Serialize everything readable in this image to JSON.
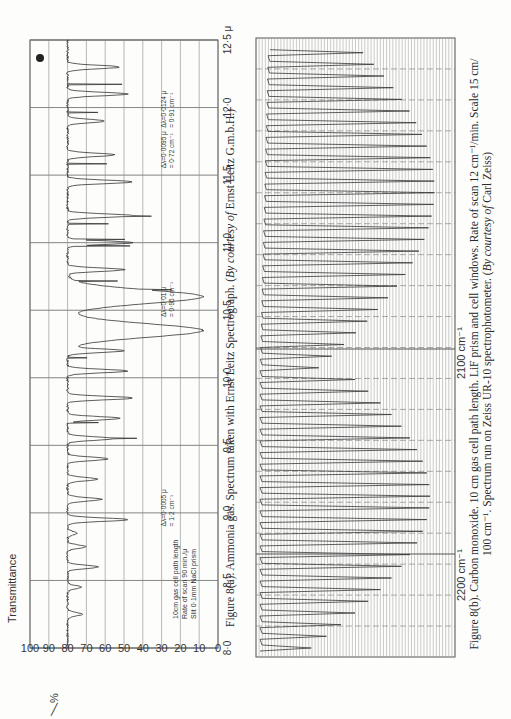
{
  "figure_a": {
    "caption_prefix": "Figure 8(a). Ammonia gas. Spectrum taken with Ernst Leitz Spectrograph. (",
    "caption_italic": "By courtesy of",
    "caption_suffix": " Ernst Leitz G.m.b.H.)",
    "y_axis_label": "Transmittance",
    "y_axis_unit": "%",
    "y_ticks": [
      "100",
      "90",
      "80",
      "70",
      "60",
      "50",
      "40",
      "30",
      "20",
      "10",
      "0"
    ],
    "x_ticks": [
      "8·0",
      "8·5",
      "9·0",
      "9·5",
      "10·0",
      "10·5",
      "11·0",
      "11·5",
      "12·0",
      "12·5 μ"
    ],
    "conditions": [
      "10cm gas cell path length",
      "Rate of scan 90 min./μ",
      "Slit 0·1mm NaCl prism"
    ],
    "annotations": [
      {
        "text1": "Δλ=0·0005 μ",
        "text2": "= 1·2 cm⁻¹",
        "at": 8.9
      },
      {
        "text1": "Δλ=0·01 μ",
        "text2": "= 0·95 cm⁻¹",
        "at": 10.45
      },
      {
        "text1": "Δλ=0·0095 μ",
        "text2": "= 0·72 cm⁻¹",
        "at": 11.55
      },
      {
        "text1": "Δλ=0·0124 μ",
        "text2": "= 0·91 cm⁻¹",
        "at": 11.85
      }
    ]
  },
  "figure_b": {
    "caption_line1_prefix": "Figure 8(b). Carbon monoxide. 10 cm gas cell path length. LiF prism and cell windows. Rate of scan 12 cm⁻¹/min. Scale 15 cm/",
    "caption_line2_prefix": "100 cm⁻¹. Spectrum run on Zeiss UR-10 spectrophotometer. (",
    "caption_italic": "By courtesy of",
    "caption_suffix": " Carl Zeiss)",
    "x_labels": [
      "2200 cm⁻¹",
      "2100 cm⁻¹"
    ]
  },
  "chart_data": [
    {
      "type": "line",
      "title": "Figure 8(a). Ammonia gas. Spectrum taken with Ernst Leitz Spectrograph.",
      "xlabel": "Wavelength (μ)",
      "ylabel": "Transmittance %",
      "xlim": [
        8.0,
        12.5
      ],
      "ylim": [
        0,
        100
      ],
      "grid": true,
      "x_ticks": [
        8.0,
        8.5,
        9.0,
        9.5,
        10.0,
        10.5,
        11.0,
        11.5,
        12.0,
        12.5
      ],
      "y_ticks": [
        0,
        10,
        20,
        30,
        40,
        50,
        60,
        70,
        80,
        90,
        100
      ],
      "baseline_transmittance": 80,
      "bands": [
        {
          "center": 8.25,
          "min_T": 72
        },
        {
          "center": 8.45,
          "min_T": 73
        },
        {
          "center": 8.6,
          "min_T": 64
        },
        {
          "center": 8.75,
          "min_T": 70
        },
        {
          "center": 8.85,
          "min_T": 75
        },
        {
          "center": 8.95,
          "min_T": 48
        },
        {
          "center": 9.1,
          "min_T": 62
        },
        {
          "center": 9.25,
          "min_T": 64
        },
        {
          "center": 9.4,
          "min_T": 58
        },
        {
          "center": 9.55,
          "min_T": 55
        },
        {
          "center": 9.7,
          "min_T": 52
        },
        {
          "center": 9.85,
          "min_T": 45
        },
        {
          "center": 10.05,
          "min_T": 48
        },
        {
          "center": 10.2,
          "min_T": 50
        },
        {
          "center": 10.35,
          "min_T": 8
        },
        {
          "center": 10.6,
          "min_T": 8
        },
        {
          "center": 10.8,
          "min_T": 50
        },
        {
          "center": 11.0,
          "min_T": 45
        },
        {
          "center": 11.2,
          "min_T": 45
        },
        {
          "center": 11.45,
          "min_T": 45
        },
        {
          "center": 11.65,
          "min_T": 55
        },
        {
          "center": 11.9,
          "min_T": 60
        },
        {
          "center": 12.1,
          "min_T": 48
        },
        {
          "center": 12.3,
          "min_T": 52
        }
      ],
      "annotations": [
        "Δλ=0·0005 μ = 1·2 cm⁻¹",
        "Δλ=0·01 μ = 0·95 cm⁻¹",
        "Δλ=0·0095 μ = 0·72 cm⁻¹",
        "Δλ=0·0124 μ = 0·91 cm⁻¹"
      ],
      "conditions": [
        "10cm gas cell path length",
        "Rate of scan 90 min./μ",
        "Slit 0·1mm NaCl prism"
      ]
    },
    {
      "type": "line",
      "title": "Figure 8(b). Carbon monoxide. 10 cm gas cell path length.",
      "xlabel": "Wavenumber (cm⁻¹)",
      "ylabel": "",
      "x_labels": [
        "2200 cm⁻¹",
        "2100 cm⁻¹"
      ],
      "xlim": [
        2240,
        2040
      ],
      "grid": true,
      "description": "Rotation-vibration fundamental of CO: R-branch (high wavenumber) and P-branch (low wavenumber) series of sharp evenly spaced absorption lines with a band gap near 2143 cm⁻¹; line depth increases toward the branch maxima.",
      "r_branch_lines": 24,
      "p_branch_lines": 28
    }
  ]
}
